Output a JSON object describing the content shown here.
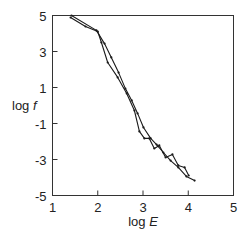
{
  "chart_data": {
    "type": "line",
    "title": "",
    "xlabel": "log E",
    "xlabel_parts": {
      "prefix": "log ",
      "var": "E"
    },
    "ylabel": "log f",
    "ylabel_parts": {
      "prefix": "log ",
      "var": "f"
    },
    "xlim": [
      1,
      5
    ],
    "ylim": [
      -5,
      5
    ],
    "x_ticks": [
      1,
      2,
      3,
      4,
      5
    ],
    "x_tick_labels": [
      "1",
      "2",
      "3",
      "4",
      "5"
    ],
    "y_ticks": [
      5,
      3,
      1,
      -1,
      -3,
      -5
    ],
    "y_tick_labels": [
      "5",
      "3",
      "1",
      "-1",
      "-3",
      "-5"
    ],
    "grid": false,
    "legend": null,
    "series": [
      {
        "name": "series-a",
        "color": "#1a1a1a",
        "x": [
          1.42,
          1.97,
          2.15,
          2.3,
          2.46,
          2.61,
          2.75,
          2.88,
          3.01,
          3.17,
          3.3,
          3.45,
          3.61,
          3.78,
          3.96,
          4.14
        ],
        "y": [
          5.0,
          4.17,
          3.44,
          2.67,
          1.83,
          0.94,
          0.28,
          -0.44,
          -1.22,
          -1.83,
          -2.17,
          -2.61,
          -3.06,
          -3.44,
          -3.94,
          -4.17
        ]
      },
      {
        "name": "series-b",
        "color": "#1a1a1a",
        "x": [
          1.4,
          1.73,
          2.0,
          2.08,
          2.22,
          2.44,
          2.64,
          2.81,
          2.92,
          3.03,
          3.14,
          3.25,
          3.36,
          3.5,
          3.65,
          3.78,
          3.92,
          4.01
        ],
        "y": [
          4.89,
          4.39,
          4.11,
          3.5,
          2.39,
          1.56,
          0.67,
          -0.28,
          -1.44,
          -1.83,
          -1.83,
          -2.39,
          -2.22,
          -2.89,
          -2.72,
          -3.33,
          -3.44,
          -3.89
        ]
      }
    ]
  }
}
